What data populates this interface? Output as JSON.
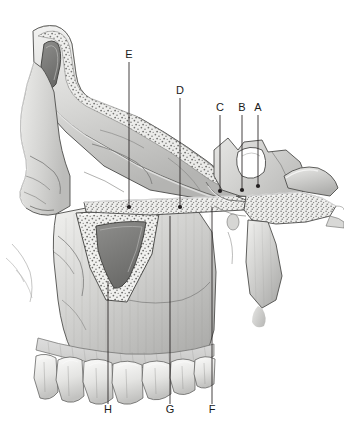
{
  "figure": {
    "background_color": "#ffffff",
    "line_color": "#231f20",
    "label_color": "#1a1a1a"
  },
  "labels": [
    {
      "id": "E",
      "text": "E",
      "x": 129,
      "y": 57,
      "line_x": 129,
      "line_y1": 62,
      "line_y2": 207
    },
    {
      "id": "D",
      "text": "D",
      "x": 180,
      "y": 93,
      "line_x": 180,
      "line_y1": 98,
      "line_y2": 207
    },
    {
      "id": "C",
      "text": "C",
      "x": 220,
      "y": 110,
      "line_x": 220,
      "line_y1": 115,
      "line_y2": 191
    },
    {
      "id": "B",
      "text": "B",
      "x": 242,
      "y": 110,
      "line_x": 242,
      "line_y1": 115,
      "line_y2": 190
    },
    {
      "id": "A",
      "text": "A",
      "x": 258,
      "y": 110,
      "line_x": 258,
      "line_y1": 115,
      "line_y2": 186
    },
    {
      "id": "H",
      "text": "H",
      "x": 108,
      "y": 412,
      "line_x": 108,
      "line_y1": 281,
      "line_y2": 404
    },
    {
      "id": "G",
      "text": "G",
      "x": 170,
      "y": 412,
      "line_x": 170,
      "line_y1": 216,
      "line_y2": 404
    },
    {
      "id": "F",
      "text": "F",
      "x": 212,
      "y": 412,
      "line_x": 212,
      "line_y1": 207,
      "line_y2": 404
    }
  ],
  "leader_dots": [
    {
      "for": "E",
      "x": 129,
      "y": 207
    },
    {
      "for": "D",
      "x": 180,
      "y": 207
    },
    {
      "for": "C",
      "x": 220,
      "y": 191
    },
    {
      "for": "B",
      "x": 242,
      "y": 190
    },
    {
      "for": "A",
      "x": 258,
      "y": 186
    }
  ],
  "regions": [
    {
      "name": "frontal-sinus",
      "description": "frontal sinus cavity, dark grey lumen with stippled cancellous bone border"
    },
    {
      "name": "nasal-bone",
      "description": "nasal bone and bridge of nose, smooth gradient shading"
    },
    {
      "name": "maxillary-sinus",
      "description": "maxillary sinus, triangular cavity with stippled cancellous bone border"
    },
    {
      "name": "sphenoid-sinus",
      "description": "sphenoid sinus, white lumen in body of sphenoid"
    },
    {
      "name": "hard-palate",
      "description": "hard palate, thin horizontal plate with stippled bone interior"
    },
    {
      "name": "pterygoid-plates",
      "description": "pterygoid plates projecting posteriorly"
    },
    {
      "name": "maxillary-teeth",
      "description": "row of upper teeth along alveolar margin"
    },
    {
      "name": "gingiva",
      "description": "gum tissue above the teeth"
    },
    {
      "name": "zygomatic-arch",
      "description": "zygomatic process region, left lateral"
    }
  ]
}
